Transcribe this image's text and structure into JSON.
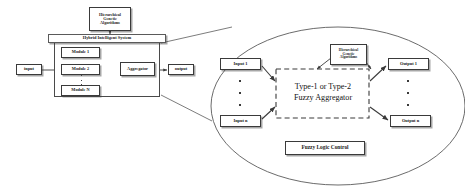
{
  "figure": {
    "type": "block-diagram"
  },
  "left_diagram": {
    "hga_box": {
      "line1": "Hierarchical",
      "line2": "Genetic",
      "line3": "Algorithms"
    },
    "system_title": "Hybrid Intelligent System",
    "input_label": "input",
    "output_label": "output",
    "modules": [
      {
        "label": "Module 1"
      },
      {
        "label": "Module 2"
      },
      {
        "label": "Module N"
      }
    ],
    "aggregator_label": "Aggregator",
    "ellipsis": "vertical-dots"
  },
  "magnified_view": {
    "shape": "ellipse",
    "inputs": [
      {
        "label": "Input 1"
      },
      {
        "label": "Input n"
      }
    ],
    "outputs": [
      {
        "label": "Output 1"
      },
      {
        "label": "Output n"
      }
    ],
    "hga_box": {
      "line1": "Hierarchical",
      "line2": "Genetic",
      "line3": "Algorithms"
    },
    "center_label": {
      "line1": "Type-1 or Type-2",
      "line2": "Fuzzy Aggregator"
    },
    "footer_box": "Fuzzy Logic Control",
    "center_region_border": "dashed"
  },
  "colors": {
    "stroke": "#3a3a3a",
    "text": "#111111",
    "background": "#ffffff"
  }
}
